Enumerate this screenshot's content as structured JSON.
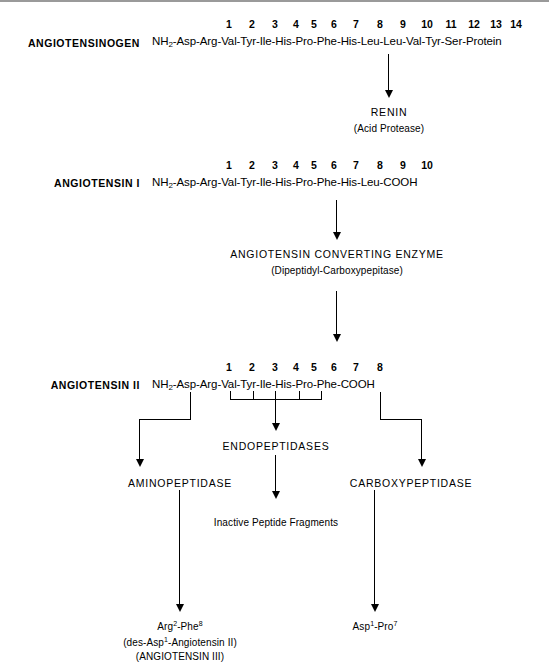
{
  "diagram": {
    "rows": {
      "angiotensinogen": {
        "label": "ANGIOTENSINOGEN",
        "numbers": [
          "1",
          "2",
          "3",
          "4",
          "5",
          "6",
          "7",
          "8",
          "9",
          "10",
          "11",
          "12",
          "13",
          "14"
        ],
        "n_terminus": "NH",
        "n_terminus_sub": "2",
        "residues": [
          "Asp",
          "Arg",
          "Val",
          "Tyr",
          "Ile",
          "His",
          "Pro",
          "Phe",
          "His",
          "Leu",
          "Leu",
          "Val",
          "Tyr",
          "Ser",
          "Protein"
        ],
        "sequence_text": "NH2-Asp-Arg-Val-Tyr-Ile-His-Pro-Phe-His-Leu-Leu-Val-Tyr-Ser-Protein"
      },
      "angiotensin_i": {
        "label": "ANGIOTENSIN I",
        "numbers": [
          "1",
          "2",
          "3",
          "4",
          "5",
          "6",
          "7",
          "8",
          "9",
          "10"
        ],
        "n_terminus": "NH",
        "n_terminus_sub": "2",
        "residues": [
          "Asp",
          "Arg",
          "Val",
          "Tyr",
          "Ile",
          "His",
          "Pro",
          "Phe",
          "His",
          "Leu",
          "COOH"
        ],
        "sequence_text": "NH2-Asp-Arg-Val-Tyr-Ile-His-Pro-Phe-His-Leu-COOH"
      },
      "angiotensin_ii": {
        "label": "ANGIOTENSIN II",
        "numbers": [
          "1",
          "2",
          "3",
          "4",
          "5",
          "6",
          "7",
          "8"
        ],
        "n_terminus": "NH",
        "n_terminus_sub": "2",
        "residues": [
          "Asp",
          "Arg",
          "Val",
          "Tyr",
          "Ile",
          "His",
          "Pro",
          "Phe",
          "COOH"
        ],
        "sequence_text": "NH2-Asp-Arg-Val-Tyr-Ile-His-Pro-Phe-COOH"
      }
    },
    "enzymes": {
      "renin": {
        "name": "RENIN",
        "subtitle": "(Acid Protease)"
      },
      "ace": {
        "name": "ANGIOTENSIN CONVERTING ENZYME",
        "subtitle": "(Dipeptidyl-Carboxypepitase)"
      },
      "aminopeptidase": {
        "name": "AMINOPEPTIDASE"
      },
      "endopeptidases": {
        "name": "ENDOPEPTIDASES"
      },
      "carboxypeptidase": {
        "name": "CARBOXYPEPTIDASE"
      }
    },
    "products": {
      "inactive_fragments": "Inactive Peptide Fragments",
      "angiotensin_iii": {
        "line1_a": "Arg",
        "line1_sup1": "2",
        "line1_b": "-Phe",
        "line1_sup2": "8",
        "line2_a": "(des-Asp",
        "line2_sup": "1",
        "line2_b": "-Angiotensin II)",
        "line3": "(ANGIOTENSIN III)"
      },
      "dipeptide": {
        "a": "Asp",
        "sup1": "1",
        "b": "-Pro",
        "sup2": "7"
      }
    }
  }
}
